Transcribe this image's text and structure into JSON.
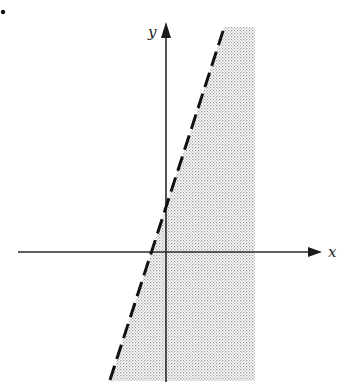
{
  "figure": {
    "marker": "•",
    "axes": {
      "x_label": "x",
      "y_label": "y"
    },
    "boundary_line": {
      "style": "dashed",
      "from": [
        110,
        380
      ],
      "to": [
        224,
        28
      ]
    },
    "shaded_region": {
      "description": "Region to the right of the dashed boundary line, bounded on the right",
      "fill": "dotted-gray"
    },
    "colors": {
      "axis": "#2a2a2a",
      "line": "#111111",
      "shade_dot": "#9a9a9a"
    }
  }
}
